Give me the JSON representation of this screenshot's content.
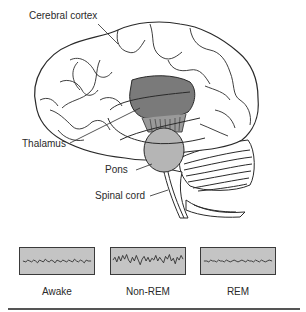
{
  "figure": {
    "labels": {
      "cerebral_cortex": "Cerebral cortex",
      "thalamus": "Thalamus",
      "pons": "Pons",
      "spinal_cord": "Spinal cord"
    },
    "colors": {
      "thalamus_region": "#7a7a7a",
      "pons_region": "#b5b5b5",
      "outline": "#2a2a2a",
      "eeg_background": "#c4c4c4",
      "eeg_border": "#3a3a3a"
    }
  },
  "eeg": {
    "panels": [
      {
        "label": "Awake",
        "pattern": "low-amplitude fast"
      },
      {
        "label": "Non-REM",
        "pattern": "high-amplitude slow"
      },
      {
        "label": "REM",
        "pattern": "low-amplitude fast"
      }
    ]
  }
}
